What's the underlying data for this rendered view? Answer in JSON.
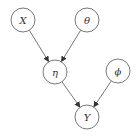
{
  "diagram": {
    "type": "directed-graph",
    "colors": {
      "stroke": "#555555",
      "fill": "#ffffff",
      "text": "#333333"
    },
    "nodes": [
      {
        "id": "X",
        "label": "X",
        "cx": 23,
        "cy": 20,
        "r": 12
      },
      {
        "id": "theta",
        "label": "θ",
        "cx": 87,
        "cy": 20,
        "r": 12
      },
      {
        "id": "eta",
        "label": "η",
        "cx": 55,
        "cy": 72,
        "r": 12
      },
      {
        "id": "phi",
        "label": "ϕ",
        "cx": 118,
        "cy": 71,
        "r": 12
      },
      {
        "id": "Y",
        "label": "Y",
        "cx": 87,
        "cy": 117,
        "r": 12
      }
    ],
    "edges": [
      {
        "from": "X",
        "to": "eta"
      },
      {
        "from": "theta",
        "to": "eta"
      },
      {
        "from": "eta",
        "to": "Y"
      },
      {
        "from": "phi",
        "to": "Y"
      }
    ]
  }
}
